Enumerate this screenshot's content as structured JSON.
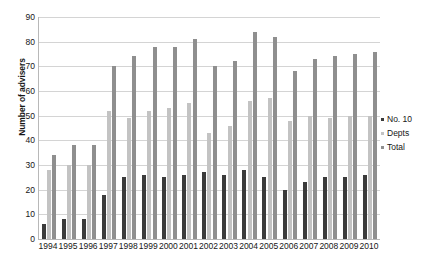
{
  "chart_data": {
    "type": "bar",
    "title": "",
    "xlabel": "",
    "ylabel": "Number of advisers",
    "ylim": [
      0,
      90
    ],
    "ytick_step": 10,
    "yticks": [
      0,
      10,
      20,
      30,
      40,
      50,
      60,
      70,
      80,
      90
    ],
    "grid": true,
    "legend_position": "right",
    "categories": [
      "1994",
      "1995",
      "1996",
      "1997",
      "1998",
      "1999",
      "2000",
      "2001",
      "2002",
      "2003",
      "2004",
      "2005",
      "2006",
      "2007",
      "2008",
      "2009",
      "2010"
    ],
    "series": [
      {
        "name": "No. 10",
        "color": "#3b3b3b",
        "values": [
          6,
          8,
          8,
          18,
          25,
          26,
          25,
          26,
          27,
          26,
          28,
          25,
          20,
          23,
          25,
          25,
          26
        ]
      },
      {
        "name": "Depts",
        "color": "#c3c3c3",
        "values": [
          28,
          30,
          30,
          52,
          49,
          52,
          53,
          55,
          43,
          46,
          56,
          57,
          48,
          50,
          49,
          50,
          50
        ]
      },
      {
        "name": "Total",
        "color": "#8f8f8f",
        "values": [
          34,
          38,
          38,
          70,
          74,
          78,
          78,
          81,
          70,
          72,
          84,
          82,
          68,
          73,
          74,
          75,
          76
        ]
      }
    ]
  },
  "legend": {
    "items": [
      {
        "label": "No. 10",
        "swatch": "legend-swatch-no10"
      },
      {
        "label": "Depts",
        "swatch": "legend-swatch-depts"
      },
      {
        "label": "Total",
        "swatch": "legend-swatch-total"
      }
    ]
  }
}
